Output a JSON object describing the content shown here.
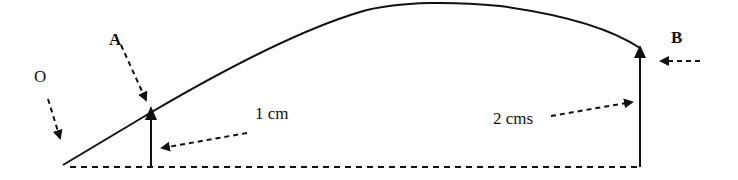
{
  "diagram": {
    "type": "curve-with-measurements",
    "labels": {
      "origin": "O",
      "point_a": "A",
      "point_b": "B",
      "height_a": "1 cm",
      "height_b": "2 cms"
    },
    "colors": {
      "stroke": "#111111",
      "background": "#ffffff"
    },
    "measurements": [
      {
        "point": "A",
        "height": "1 cm"
      },
      {
        "point": "B",
        "height": "2 cms"
      }
    ]
  }
}
